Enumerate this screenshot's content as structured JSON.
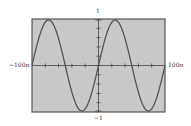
{
  "chart_data": {
    "type": "line",
    "title": "",
    "xlabel": "",
    "ylabel": "",
    "function": "y = sin(x/50)",
    "xlim": [
      "-100π",
      "100π"
    ],
    "ylim": [
      -1,
      1
    ],
    "x_tick_labels": {
      "min": "−100π",
      "max": "100π"
    },
    "y_tick_labels": {
      "max": "1",
      "min": "−1"
    },
    "x_ticks_count": 10,
    "y_ticks_count": 10,
    "grid": false,
    "legend": null,
    "series": [
      {
        "name": "sin",
        "x": [
          "-100π",
          "-75π",
          "-50π",
          "-25π",
          "0",
          "25π",
          "50π",
          "75π",
          "100π"
        ],
        "values": [
          0,
          1,
          0,
          -1,
          0,
          1,
          0,
          -1,
          0
        ]
      }
    ],
    "colors": {
      "plot_background": "#c8c8c8",
      "frame": "#555555",
      "curve": "#555555",
      "axes": "#444444"
    }
  },
  "labels": {
    "y_max": "1",
    "y_min": "−1",
    "x_min": "−100π",
    "x_max": "100π"
  }
}
